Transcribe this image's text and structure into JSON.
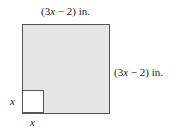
{
  "diagram": {
    "top_label": {
      "open": "(3",
      "var": "x",
      "rest": " − 2) in."
    },
    "right_label": {
      "open": "(3",
      "var": "x",
      "rest": " − 2) in."
    },
    "left_label": "x",
    "bottom_label": "x",
    "colors": {
      "large_square_fill": "#e6e6e6",
      "small_square_fill": "#ffffff",
      "stroke": "#555555"
    }
  }
}
